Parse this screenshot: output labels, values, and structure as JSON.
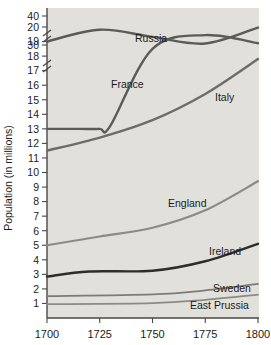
{
  "chart_data": {
    "type": "line",
    "title": "",
    "xlabel": "",
    "ylabel": "Population (in millions)",
    "x_ticks": [
      1700,
      1725,
      1750,
      1775,
      1800
    ],
    "xlim": [
      1700,
      1800
    ],
    "y_ticks": [
      1,
      2,
      3,
      4,
      5,
      6,
      7,
      8,
      9,
      10,
      11,
      12,
      13,
      14,
      15,
      16,
      17,
      18,
      19,
      20,
      30,
      40
    ],
    "y_axis_broken": true,
    "y_axis_breaks": [
      "between 20 and 30",
      "between 30 and 40"
    ],
    "ylim": [
      0,
      40
    ],
    "grid": false,
    "legend": "inline-labels",
    "background_color": "#e2e0db",
    "series": [
      {
        "name": "Russia",
        "color": "#5d5b58",
        "width": 2.4,
        "x": [
          1700,
          1725,
          1750,
          1775,
          1800
        ],
        "values": [
          19,
          21.5,
          25.5,
          30.5,
          36
        ]
      },
      {
        "name": "France",
        "color": "#5d5b58",
        "width": 2.4,
        "x": [
          1700,
          1715,
          1725,
          1730,
          1750,
          1775,
          1800
        ],
        "values": [
          13,
          13,
          13,
          13.2,
          18.5,
          24.5,
          29
        ]
      },
      {
        "name": "Italy",
        "color": "#6e6c68",
        "width": 2.4,
        "x": [
          1700,
          1725,
          1750,
          1775,
          1800
        ],
        "values": [
          11.5,
          12.4,
          13.6,
          15.4,
          17.8
        ]
      },
      {
        "name": "England",
        "color": "#8c8a85",
        "width": 2.2,
        "x": [
          1700,
          1725,
          1750,
          1775,
          1800
        ],
        "values": [
          5.0,
          5.6,
          6.2,
          7.4,
          9.4
        ]
      },
      {
        "name": "Ireland",
        "color": "#2e2d2b",
        "width": 2.4,
        "x": [
          1700,
          1720,
          1750,
          1775,
          1800
        ],
        "values": [
          2.85,
          3.2,
          3.25,
          3.9,
          5.1
        ]
      },
      {
        "name": "Sweden",
        "color": "#7d7b77",
        "width": 1.8,
        "x": [
          1700,
          1750,
          1775,
          1800
        ],
        "values": [
          1.5,
          1.62,
          1.9,
          2.35
        ]
      },
      {
        "name": "East Prussia",
        "color": "#8c8a85",
        "width": 1.8,
        "x": [
          1700,
          1750,
          1775,
          1800
        ],
        "values": [
          0.95,
          1.02,
          1.25,
          1.6
        ]
      }
    ],
    "series_labels": [
      {
        "name": "Russia",
        "x": 135,
        "y": 42
      },
      {
        "name": "France",
        "x": 111,
        "y": 88
      },
      {
        "name": "Italy",
        "x": 215,
        "y": 101
      },
      {
        "name": "England",
        "x": 168,
        "y": 207
      },
      {
        "name": "Ireland",
        "x": 209,
        "y": 255
      },
      {
        "name": "Sweden",
        "x": 213,
        "y": 292
      },
      {
        "name": "East Prussia",
        "x": 190,
        "y": 309
      }
    ]
  }
}
